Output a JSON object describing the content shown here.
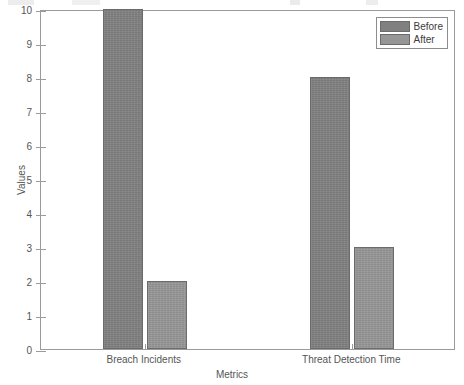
{
  "chart_data": {
    "type": "bar",
    "title": "",
    "xlabel": "Metrics",
    "ylabel": "Values",
    "categories": [
      "Breach Incidents",
      "Threat Detection Time"
    ],
    "series": [
      {
        "name": "Before",
        "values": [
          10,
          8
        ],
        "color": "#808080"
      },
      {
        "name": "After",
        "values": [
          2,
          3
        ],
        "color": "#969696"
      }
    ],
    "ylim": [
      0,
      10
    ],
    "ytick_labels": [
      "10",
      "9",
      "8",
      "7",
      "6",
      "5",
      "4",
      "3",
      "2",
      "1",
      "0"
    ],
    "ytick_values": [
      10,
      9,
      8,
      7,
      6,
      5,
      4,
      3,
      2,
      1,
      0
    ],
    "grid": false,
    "legend_position": "top-right"
  },
  "axes": {
    "y_label": "Values",
    "x_label": "Metrics",
    "y_ticks": [
      {
        "label": "10",
        "value": 10
      },
      {
        "label": "9",
        "value": 9
      },
      {
        "label": "8",
        "value": 8
      },
      {
        "label": "7",
        "value": 7
      },
      {
        "label": "6",
        "value": 6
      },
      {
        "label": "5",
        "value": 5
      },
      {
        "label": "4",
        "value": 4
      },
      {
        "label": "3",
        "value": 3
      },
      {
        "label": "2",
        "value": 2
      },
      {
        "label": "1",
        "value": 1
      },
      {
        "label": "0",
        "value": 0
      }
    ],
    "x_categories": [
      {
        "label": "Breach Incidents"
      },
      {
        "label": "Threat Detection Time"
      }
    ]
  },
  "legend": {
    "entries": [
      {
        "label": "Before",
        "color": "#808080"
      },
      {
        "label": "After",
        "color": "#969696"
      }
    ]
  },
  "bars": [
    {
      "name": "breach-incidents-before",
      "series": "Before",
      "category": "Breach Incidents",
      "value": 10
    },
    {
      "name": "breach-incidents-after",
      "series": "After",
      "category": "Breach Incidents",
      "value": 2
    },
    {
      "name": "threat-detection-time-before",
      "series": "Before",
      "category": "Threat Detection Time",
      "value": 8
    },
    {
      "name": "threat-detection-time-after",
      "series": "After",
      "category": "Threat Detection Time",
      "value": 3
    }
  ]
}
